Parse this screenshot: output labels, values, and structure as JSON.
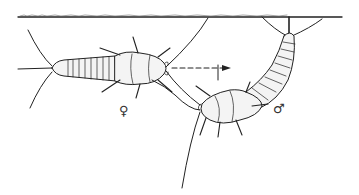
{
  "figure": {
    "labels": {
      "female_symbol": "♀",
      "male_symbol": "♂"
    },
    "colors": {
      "ink": "#222222",
      "body_fill": "#f4f4f4",
      "background": "#ffffff"
    }
  }
}
